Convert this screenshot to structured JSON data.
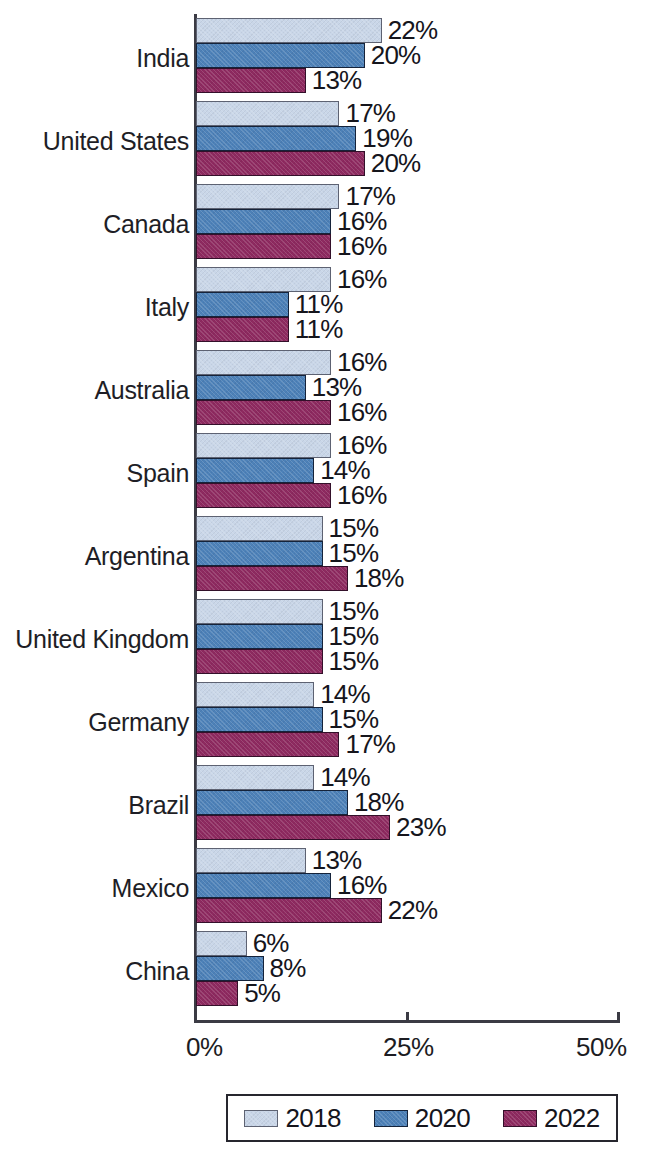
{
  "chart_data": {
    "type": "bar",
    "orientation": "horizontal",
    "title": "",
    "xlabel": "",
    "ylabel": "",
    "xlim": [
      0,
      50
    ],
    "x_tick_labels": [
      "0%",
      "25%",
      "50%"
    ],
    "x_tick_values": [
      0,
      25,
      50
    ],
    "grid": false,
    "legend_position": "bottom",
    "value_suffix": "%",
    "categories": [
      "India",
      "United States",
      "Canada",
      "Italy",
      "Australia",
      "Spain",
      "Argentina",
      "United Kingdom",
      "Germany",
      "Brazil",
      "Mexico",
      "China"
    ],
    "series": [
      {
        "name": "2018",
        "color": "#c9d6e8",
        "values": [
          22,
          17,
          17,
          16,
          16,
          16,
          15,
          15,
          14,
          14,
          13,
          6
        ],
        "labels": [
          "22%",
          "17%",
          "17%",
          "16%",
          "16%",
          "16%",
          "15%",
          "15%",
          "14%",
          "14%",
          "13%",
          "6%"
        ]
      },
      {
        "name": "2020",
        "color": "#4d81b8",
        "values": [
          20,
          19,
          16,
          11,
          13,
          14,
          15,
          15,
          15,
          18,
          16,
          8
        ],
        "labels": [
          "20%",
          "19%",
          "16%",
          "11%",
          "13%",
          "14%",
          "15%",
          "15%",
          "15%",
          "18%",
          "16%",
          "8%"
        ]
      },
      {
        "name": "2022",
        "color": "#8e2a60",
        "values": [
          13,
          20,
          16,
          11,
          16,
          16,
          18,
          15,
          17,
          23,
          22,
          5
        ],
        "labels": [
          "13%",
          "20%",
          "16%",
          "11%",
          "16%",
          "16%",
          "18%",
          "15%",
          "17%",
          "23%",
          "22%",
          "5%"
        ]
      }
    ]
  },
  "legend": {
    "items": [
      {
        "label": "2018",
        "swatch": "s2018"
      },
      {
        "label": "2020",
        "swatch": "s2020"
      },
      {
        "label": "2022",
        "swatch": "s2022"
      }
    ]
  },
  "axis": {
    "ticks": [
      {
        "label": "0%",
        "value": 0
      },
      {
        "label": "25%",
        "value": 25
      },
      {
        "label": "50%",
        "value": 50
      }
    ]
  }
}
